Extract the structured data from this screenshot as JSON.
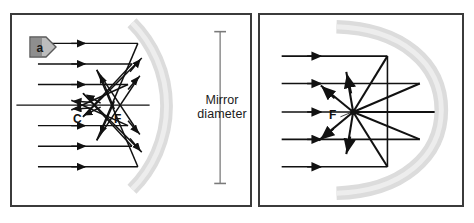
{
  "figure": {
    "background_color": "#ffffff",
    "frame_color": "#3b3b3b",
    "mirror_color": "#d9d9d9",
    "ray_color": "#111111",
    "width": 474,
    "height": 223
  },
  "panels": [
    {
      "id": "a",
      "badge_label": "a",
      "badge_shape": "right-pointing-triangle",
      "badge_fill": "#9a9a9a",
      "mirror_type": "spherical concave mirror",
      "behavior": "spherical aberration - parallel rays do not converge to a single point",
      "incoming_ray_count": 7,
      "incoming_ray_y": [
        42,
        63,
        84,
        105,
        126,
        147,
        168
      ],
      "points": [
        {
          "name": "C",
          "label": "C",
          "description": "center of curvature",
          "x": 78,
          "y": 105
        },
        {
          "name": "F",
          "label": "F",
          "description": "focal point",
          "x": 120,
          "y": 105
        }
      ],
      "dimension": {
        "label_line_1": "Mirror",
        "label_line_2": "diameter",
        "orientation": "vertical",
        "top_y": 30,
        "bottom_y": 185,
        "x": 222
      }
    },
    {
      "id": "b",
      "badge_label": "b",
      "badge_shape": "right-pointing-triangle",
      "badge_fill": "#9a9a9a",
      "mirror_type": "parabolic concave mirror",
      "behavior": "all parallel rays converge at a single focal point",
      "incoming_ray_count": 5,
      "incoming_ray_y": [
        55,
        83,
        112,
        140,
        168
      ],
      "points": [
        {
          "name": "F",
          "label": "F",
          "description": "focal point",
          "x": 345,
          "y": 112
        }
      ]
    }
  ]
}
